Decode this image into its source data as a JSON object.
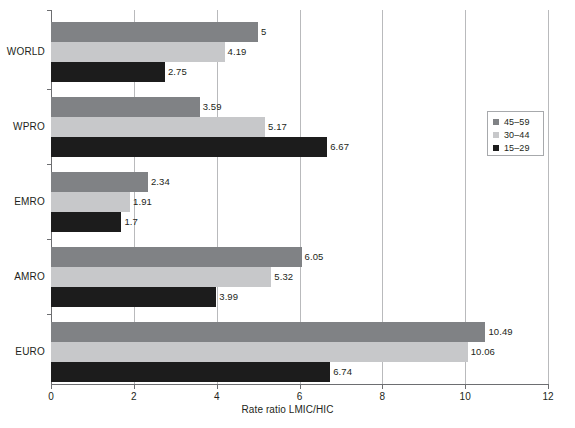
{
  "chart_data": {
    "type": "bar",
    "orientation": "horizontal",
    "title": "",
    "subtitle": "",
    "xlabel": "Rate ratio LMIC/HIC",
    "ylabel": "",
    "xlim": [
      0,
      12
    ],
    "xticks": [
      0,
      2,
      4,
      6,
      8,
      10,
      12
    ],
    "xticklabels": [
      "0",
      "2",
      "4",
      "6",
      "8",
      "10",
      "12"
    ],
    "grid": "vertical",
    "legend_position": "right-upper",
    "categories": [
      "WORLD",
      "WPRO",
      "EMRO",
      "AMRO",
      "EURO"
    ],
    "series": [
      {
        "name": "45–59",
        "color": "#808285",
        "values": [
          5,
          3.59,
          2.34,
          6.05,
          10.49
        ],
        "labels": [
          "5",
          "3.59",
          "2.34",
          "6.05",
          "10.49"
        ]
      },
      {
        "name": "30–44",
        "color": "#c7c8ca",
        "values": [
          4.19,
          5.17,
          1.91,
          5.32,
          10.06
        ],
        "labels": [
          "4.19",
          "5.17",
          "1.91",
          "5.32",
          "10.06"
        ]
      },
      {
        "name": "15–29",
        "color": "#1c1c1c",
        "values": [
          2.75,
          6.67,
          1.7,
          3.99,
          6.74
        ],
        "labels": [
          "2.75",
          "6.67",
          "1.7",
          "3.99",
          "6.74"
        ]
      }
    ]
  },
  "axis": {
    "x_title": "Rate ratio LMIC/HIC",
    "tick_0": "0",
    "tick_1": "2",
    "tick_2": "4",
    "tick_3": "6",
    "tick_4": "8",
    "tick_5": "10",
    "tick_6": "12"
  },
  "categories": {
    "c0": "WORLD",
    "c1": "WPRO",
    "c2": "EMRO",
    "c3": "AMRO",
    "c4": "EURO"
  },
  "legend": {
    "items": [
      {
        "label": "45–59",
        "color": "#808285"
      },
      {
        "label": "30–44",
        "color": "#c7c8ca"
      },
      {
        "label": "15–29",
        "color": "#1c1c1c"
      }
    ]
  },
  "values": {
    "world": {
      "s0": "5",
      "s1": "4.19",
      "s2": "2.75"
    },
    "wpro": {
      "s0": "3.59",
      "s1": "5.17",
      "s2": "6.67"
    },
    "emro": {
      "s0": "2.34",
      "s1": "1.91",
      "s2": "1.7"
    },
    "amro": {
      "s0": "6.05",
      "s1": "5.32",
      "s2": "3.99"
    },
    "euro": {
      "s0": "10.49",
      "s1": "10.06",
      "s2": "6.74"
    }
  },
  "colors": {
    "series_45_59": "#808285",
    "series_30_44": "#c7c8ca",
    "series_15_29": "#1c1c1c",
    "axis": "#6d6e71",
    "grid": "#b9babc",
    "text": "#231f20"
  }
}
